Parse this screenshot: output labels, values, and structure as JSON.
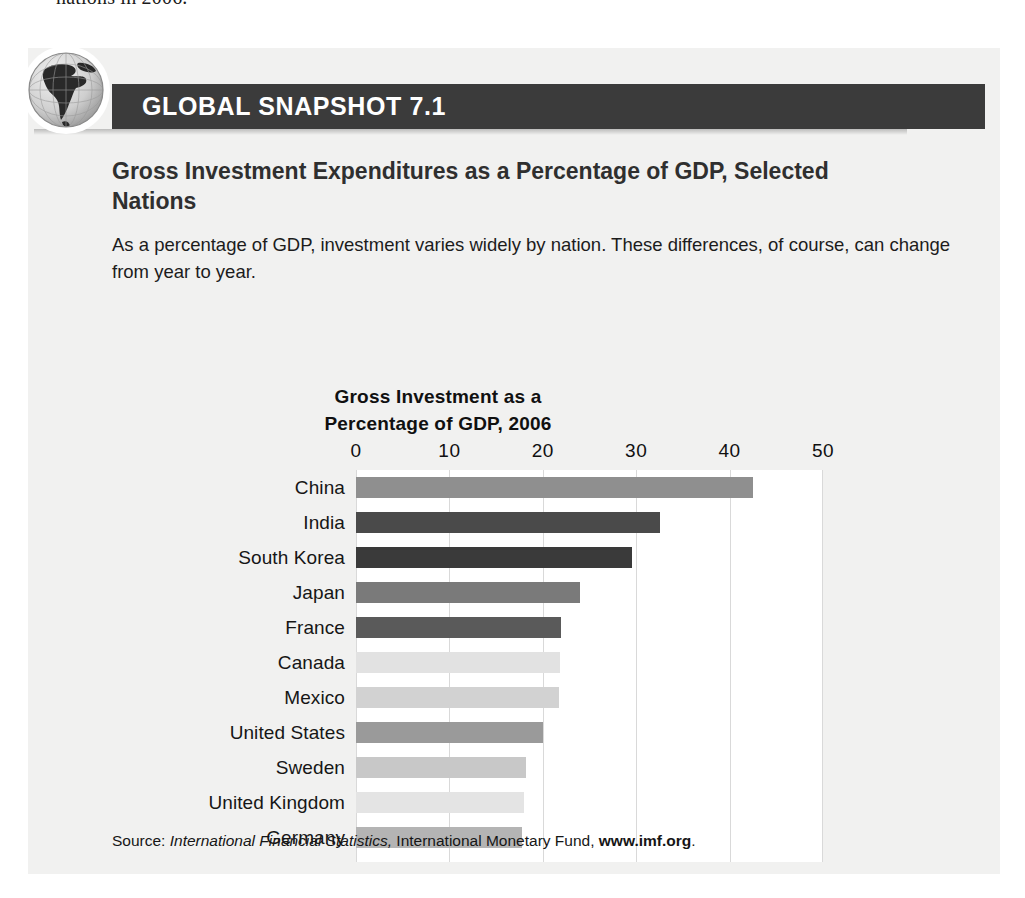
{
  "page": {
    "cutoff_text": "nations in 2006."
  },
  "snapshot": {
    "badge_icon": "globe-icon",
    "banner_label": "GLOBAL SNAPSHOT 7.1",
    "headline": "Gross Investment Expenditures as a Percentage of GDP, Selected Nations",
    "lede": "As a percentage of GDP, investment varies widely by nation. These differences, of course, can change from year to year.",
    "source": {
      "prefix": "Source:",
      "italic_part": "International Financial Statistics,",
      "middle_part": "International Monetary Fund,",
      "bold_part": "www.imf.org",
      "suffix": "."
    },
    "colors": {
      "panel_background": "#f1f1f0",
      "banner_background": "#3b3b3b",
      "banner_text": "#ffffff",
      "headline_text": "#2f2f2f",
      "plot_background": "#ffffff",
      "gridline": "#d9d9d9"
    }
  },
  "chart_data": {
    "type": "bar",
    "orientation": "horizontal",
    "title": "Gross Investment as a\nPercentage of GDP, 2006",
    "title_line1": "Gross Investment as a",
    "title_line2": "Percentage of GDP, 2006",
    "xlabel": "",
    "ylabel": "",
    "xlim": [
      0,
      50
    ],
    "xticks": [
      0,
      10,
      20,
      30,
      40,
      50
    ],
    "xtick_labels": [
      "0",
      "10",
      "20",
      "30",
      "40",
      "50"
    ],
    "grid": true,
    "legend": "none",
    "categories": [
      "China",
      "India",
      "South Korea",
      "Japan",
      "France",
      "Canada",
      "Mexico",
      "United States",
      "Sweden",
      "United Kingdom",
      "Germany"
    ],
    "values": [
      42.5,
      32.5,
      29.5,
      24.0,
      22.0,
      21.8,
      21.7,
      20.0,
      18.2,
      18.0,
      17.8
    ],
    "bar_colors": [
      "#8f8f8f",
      "#4a4a4a",
      "#3a3a3a",
      "#7a7a7a",
      "#5a5a5a",
      "#e2e2e2",
      "#d2d2d2",
      "#9a9a9a",
      "#c8c8c8",
      "#e4e4e4",
      "#b4b4b4"
    ]
  }
}
